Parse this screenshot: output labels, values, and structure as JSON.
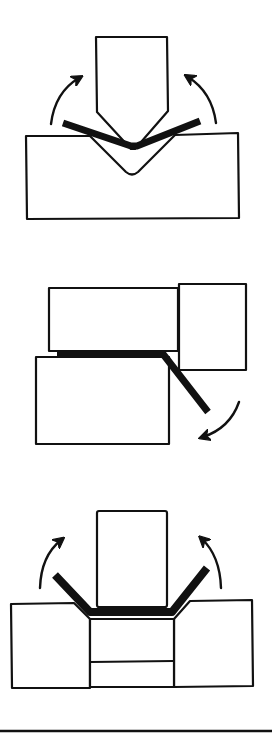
{
  "diagram": {
    "colors": {
      "stroke": "#111111",
      "background": "#ffffff"
    },
    "figures": [
      {
        "id": "v-bending",
        "parts": [
          "punch",
          "v-die",
          "sheet",
          "arrow-left-up",
          "arrow-right-up"
        ]
      },
      {
        "id": "wipe-bending",
        "parts": [
          "pressure-pad",
          "wiper-block",
          "lower-die",
          "sheet",
          "arrow-down-left"
        ]
      },
      {
        "id": "u-bending",
        "parts": [
          "punch",
          "die-left",
          "die-right",
          "ejector-pad",
          "sheet",
          "arrow-left-up",
          "arrow-right-up"
        ]
      }
    ],
    "caption": ""
  }
}
